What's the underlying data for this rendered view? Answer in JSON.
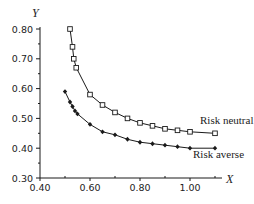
{
  "chart_data": {
    "type": "line",
    "title": "",
    "xlabel": "X",
    "ylabel": "Y",
    "xlim": [
      0.4,
      1.12
    ],
    "ylim": [
      0.3,
      0.82
    ],
    "x_ticks": [
      "0.40",
      "0.60",
      "0.80",
      "1.00"
    ],
    "x_minor_ticks": [
      0.5,
      0.7,
      0.9,
      1.1
    ],
    "y_ticks": [
      "0.30",
      "0.40",
      "0.50",
      "0.60",
      "0.70",
      "0.80"
    ],
    "y_minor_ticks": [
      0.35,
      0.45,
      0.55,
      0.65,
      0.75
    ],
    "grid": false,
    "legend": "inline labels at right end of each curve",
    "series": [
      {
        "name": "Risk neutral",
        "marker": "open-square",
        "x": [
          0.52,
          0.53,
          0.535,
          0.545,
          0.6,
          0.65,
          0.7,
          0.75,
          0.8,
          0.85,
          0.9,
          0.95,
          1.0,
          1.1
        ],
        "y": [
          0.8,
          0.74,
          0.7,
          0.67,
          0.58,
          0.545,
          0.52,
          0.5,
          0.485,
          0.475,
          0.465,
          0.46,
          0.455,
          0.45
        ]
      },
      {
        "name": "Risk averse",
        "marker": "filled-diamond",
        "x": [
          0.5,
          0.52,
          0.53,
          0.54,
          0.55,
          0.6,
          0.65,
          0.7,
          0.75,
          0.8,
          0.85,
          0.9,
          0.95,
          1.0,
          1.1
        ],
        "y": [
          0.59,
          0.555,
          0.54,
          0.525,
          0.515,
          0.48,
          0.455,
          0.445,
          0.43,
          0.42,
          0.415,
          0.41,
          0.405,
          0.4,
          0.4
        ]
      }
    ]
  },
  "labels": {
    "x_axis": "X",
    "y_axis": "Y",
    "series_1": "Risk neutral",
    "series_2": "Risk averse"
  },
  "colors": {
    "line": "#1a1a1a",
    "background": "#ffffff"
  }
}
